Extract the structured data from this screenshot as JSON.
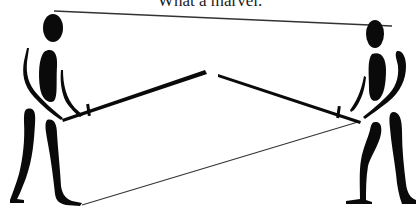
{
  "caption": "What a marvel.",
  "figures": [
    {
      "name": "left-figure",
      "facing": "right"
    },
    {
      "name": "right-figure",
      "facing": "left"
    }
  ],
  "colors": {
    "ink": "#0a0a0a",
    "thin_line": "#333333",
    "background": "#ffffff"
  }
}
